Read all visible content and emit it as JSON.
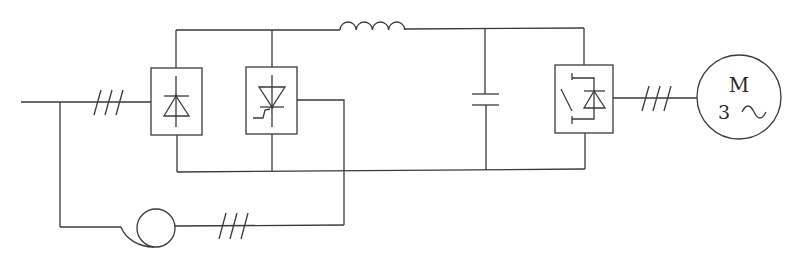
{
  "diagram": {
    "line_color": "#3a3a3a",
    "background": "#ffffff",
    "components": [
      {
        "id": "ac-supply",
        "label": "",
        "type": "three-phase AC input line"
      },
      {
        "id": "diode-rectifier",
        "label": "",
        "type": "diode rectifier bridge"
      },
      {
        "id": "thyristor-converter",
        "label": "",
        "type": "thyristor converter"
      },
      {
        "id": "dc-inductor",
        "label": "",
        "type": "inductor"
      },
      {
        "id": "dc-capacitor",
        "label": "",
        "type": "capacitor"
      },
      {
        "id": "inverter",
        "label": "",
        "type": "IGBT / switch with antiparallel diode"
      },
      {
        "id": "transformer",
        "label": "",
        "type": "transformer / current transformer"
      },
      {
        "id": "motor",
        "label": "M",
        "sublabel": "3 ~",
        "type": "three-phase motor"
      }
    ],
    "phase_markers": [
      {
        "id": "input",
        "count": 3
      },
      {
        "id": "output",
        "count": 3
      },
      {
        "id": "feedback",
        "count": 3
      }
    ],
    "motor": {
      "letter": "M",
      "phases": "3",
      "ac_symbol": "~"
    }
  }
}
